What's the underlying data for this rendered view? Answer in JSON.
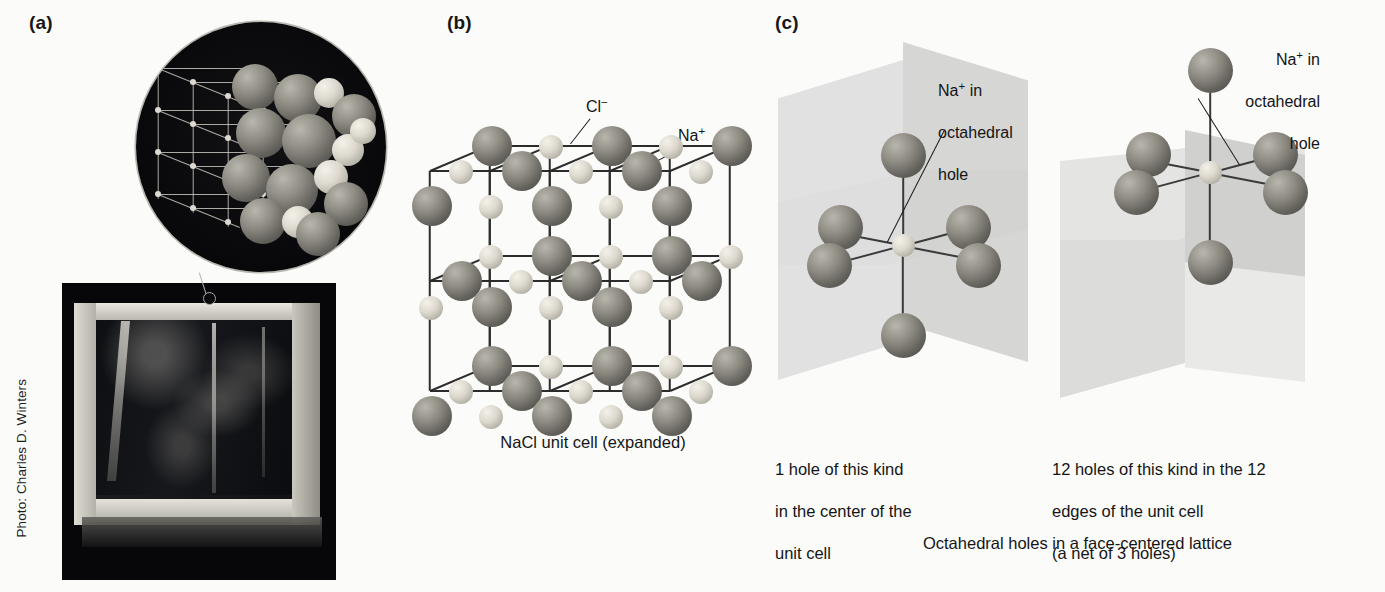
{
  "figure": {
    "panels": [
      {
        "letter": "(a)",
        "name": "photo-panel"
      },
      {
        "letter": "(b)",
        "name": "unit-cell-panel"
      },
      {
        "letter": "(c)",
        "name": "octahedral-holes-panel"
      }
    ],
    "photo_credit": "Photo: Charles D. Winters"
  },
  "panel_b": {
    "letter": "(b)",
    "label_chloride": "Cl−",
    "label_chloride_base": "Cl",
    "label_chloride_charge": "−",
    "label_sodium_base": "Na",
    "label_sodium_charge": "+",
    "caption": "NaCl unit cell (expanded)"
  },
  "panel_c": {
    "letter": "(c)",
    "left": {
      "callout_line1_base": "Na",
      "callout_line1_charge": "+",
      "callout_line1_rest": " in",
      "callout_line2": "octahedral",
      "callout_line3": "hole",
      "caption_line1": "1 hole of this kind",
      "caption_line2": "in the center of the",
      "caption_line3": "unit cell"
    },
    "right": {
      "callout_line1_base": "Na",
      "callout_line1_charge": "+",
      "callout_line1_rest": " in",
      "callout_line2": "octahedral",
      "callout_line3": "hole",
      "caption_line1": "12 holes of this kind in the 12",
      "caption_line2": "edges of the unit cell",
      "caption_line3": "(a net of 3 holes)"
    },
    "bottom_caption": "Octahedral holes in a face-centered lattice"
  },
  "colors": {
    "background": "#fbfbfa",
    "text": "#151515",
    "anion_sphere": "#8e8b83",
    "cation_sphere": "#ddd9cf",
    "plane_fill": "#d8d8d6",
    "photo_dark": "#07070a",
    "bond": "#2c2c2c"
  }
}
